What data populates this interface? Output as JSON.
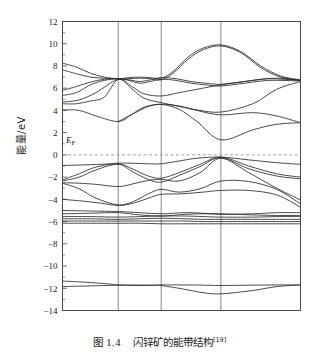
{
  "figure": {
    "caption_label": "图 1.4",
    "caption_text": "闪锌矿的能带结构",
    "caption_ref": "[19]",
    "ylabel": "能量/eV",
    "fermi_label": "E",
    "fermi_label_sub": "F"
  },
  "chart_data": {
    "type": "line",
    "title": "闪锌矿的能带结构",
    "xlabel": "",
    "ylabel": "能量/eV",
    "ylim": [
      -14,
      12
    ],
    "yticks": [
      12,
      10,
      8,
      6,
      4,
      2,
      0,
      -2,
      -4,
      -6,
      -8,
      -10,
      -12,
      -14
    ],
    "xticks": [
      "X",
      "R",
      "M",
      "G",
      "R"
    ],
    "xtick_positions": [
      0,
      1,
      2,
      3,
      4
    ],
    "grid": "vertical-only",
    "legend": "none",
    "annotations": [
      {
        "text": "E_F",
        "value": 0,
        "style": "dashed-horizontal-line"
      }
    ],
    "fermi_level": 0,
    "xlim": [
      0,
      4
    ],
    "segment_widths": [
      0.7,
      0.54,
      0.75,
      1.0
    ],
    "series": [
      {
        "name": "cb-1",
        "x": [
          0,
          0.25,
          0.5,
          0.75,
          1,
          1.25,
          1.5,
          1.75,
          2,
          2.2,
          2.45,
          2.7,
          3,
          3.25,
          3.5,
          3.75,
          4
        ],
        "values": [
          8.25,
          7.9,
          7.35,
          7.0,
          6.85,
          6.95,
          7.0,
          6.95,
          6.9,
          7.5,
          8.8,
          9.6,
          9.9,
          9.3,
          8.0,
          7.1,
          6.75
        ]
      },
      {
        "name": "cb-2",
        "x": [
          0,
          0.25,
          0.5,
          0.75,
          1,
          1.25,
          1.5,
          1.75,
          2,
          2.2,
          2.45,
          2.7,
          3,
          3.25,
          3.5,
          3.75,
          4
        ],
        "values": [
          7.65,
          7.3,
          7.0,
          6.9,
          6.85,
          6.85,
          6.9,
          6.85,
          6.75,
          7.35,
          8.6,
          9.45,
          9.8,
          9.2,
          7.85,
          7.0,
          6.7
        ]
      },
      {
        "name": "cb-3",
        "x": [
          0,
          0.25,
          0.5,
          0.75,
          1,
          1.25,
          1.5,
          1.75,
          2,
          2.25,
          2.5,
          2.75,
          3,
          3.3,
          3.6,
          4
        ],
        "values": [
          5.8,
          6.15,
          6.55,
          6.8,
          6.85,
          6.75,
          6.6,
          6.75,
          6.95,
          6.85,
          6.6,
          6.45,
          6.35,
          6.6,
          6.85,
          6.7
        ]
      },
      {
        "name": "cb-4",
        "x": [
          0,
          0.25,
          0.5,
          0.75,
          1,
          1.25,
          1.5,
          1.75,
          2,
          2.25,
          2.5,
          2.75,
          3,
          3.3,
          3.6,
          4
        ],
        "values": [
          5.35,
          5.6,
          6.3,
          6.7,
          6.85,
          6.7,
          6.45,
          6.6,
          6.8,
          6.7,
          6.45,
          6.3,
          6.2,
          6.45,
          6.7,
          6.65
        ]
      },
      {
        "name": "cb-5",
        "x": [
          0,
          0.3,
          0.6,
          1,
          1.3,
          1.6,
          2,
          2.3,
          2.6,
          3,
          3.4,
          3.7,
          4
        ],
        "values": [
          4.75,
          4.95,
          5.6,
          6.8,
          6.2,
          5.5,
          5.3,
          5.6,
          5.9,
          6.3,
          6.7,
          6.9,
          6.7
        ]
      },
      {
        "name": "cb-6",
        "x": [
          0,
          0.25,
          0.5,
          0.75,
          1,
          1.3,
          1.6,
          2,
          2.3,
          2.6,
          3,
          3.4,
          3.7,
          4
        ],
        "values": [
          4.6,
          4.6,
          4.85,
          5.2,
          6.8,
          6.0,
          5.1,
          4.7,
          4.35,
          4.05,
          3.85,
          4.6,
          5.9,
          6.6
        ]
      },
      {
        "name": "cb-7",
        "x": [
          0,
          0.3,
          0.6,
          1,
          1.3,
          1.6,
          2,
          2.3,
          2.6,
          3,
          3.4,
          3.7,
          4
        ],
        "values": [
          4.05,
          4.0,
          3.5,
          3.0,
          3.6,
          4.3,
          4.55,
          4.4,
          4.0,
          3.6,
          3.8,
          3.5,
          2.9
        ]
      },
      {
        "name": "cb-8",
        "x": [
          1,
          1.4,
          1.7,
          2,
          2.3,
          2.6,
          3,
          3.4,
          3.7,
          4
        ],
        "values": [
          3.0,
          3.8,
          4.35,
          4.55,
          4.1,
          3.0,
          1.35,
          2.25,
          2.75,
          2.9
        ]
      },
      {
        "name": "vb-1",
        "x": [
          0,
          0.4,
          0.8,
          1,
          1.3,
          1.7,
          2,
          2.3,
          2.6,
          3,
          3.35,
          3.7,
          4
        ],
        "values": [
          -0.95,
          -0.9,
          -0.82,
          -0.75,
          -0.75,
          -0.8,
          -0.8,
          -0.55,
          -0.3,
          -0.2,
          -0.45,
          -0.7,
          -0.85
        ]
      },
      {
        "name": "vb-2",
        "x": [
          0,
          0.3,
          0.6,
          1,
          1.35,
          1.7,
          2,
          2.3,
          2.65,
          3,
          3.35,
          3.7,
          4
        ],
        "values": [
          -2.25,
          -1.7,
          -1.1,
          -0.8,
          -1.3,
          -1.9,
          -2.1,
          -1.6,
          -0.85,
          -0.2,
          -1.0,
          -1.7,
          -2.0
        ]
      },
      {
        "name": "vb-3",
        "x": [
          0,
          0.3,
          0.6,
          1,
          1.35,
          1.7,
          2,
          2.3,
          2.65,
          3,
          3.35,
          3.7,
          4
        ],
        "values": [
          -2.35,
          -2.0,
          -1.35,
          -0.85,
          -1.55,
          -2.2,
          -2.45,
          -1.85,
          -1.05,
          -0.25,
          -1.25,
          -1.9,
          -2.15
        ]
      },
      {
        "name": "vb-4",
        "x": [
          0,
          0.3,
          0.6,
          1,
          1.35,
          1.7,
          2,
          2.3,
          2.65,
          3,
          3.35,
          3.7,
          4
        ],
        "values": [
          -2.5,
          -2.55,
          -2.65,
          -2.85,
          -2.6,
          -2.3,
          -2.2,
          -2.35,
          -1.6,
          -0.3,
          -1.6,
          -3.0,
          -4.05
        ]
      },
      {
        "name": "vb-5",
        "x": [
          0,
          0.3,
          0.6,
          1,
          1.35,
          1.7,
          2,
          2.3,
          2.65,
          3,
          3.35,
          3.7,
          4
        ],
        "values": [
          -2.55,
          -3.05,
          -3.9,
          -4.5,
          -4.2,
          -3.5,
          -3.1,
          -3.35,
          -3.05,
          -2.35,
          -2.4,
          -3.1,
          -4.4
        ]
      },
      {
        "name": "vb-6",
        "x": [
          0,
          0.35,
          0.7,
          1,
          1.35,
          1.7,
          2,
          2.35,
          2.7,
          3,
          3.35,
          3.7,
          4
        ],
        "values": [
          -4.0,
          -4.15,
          -4.35,
          -4.55,
          -4.35,
          -3.9,
          -3.55,
          -3.5,
          -3.35,
          -3.2,
          -3.2,
          -3.6,
          -4.7
        ]
      },
      {
        "name": "vb-7",
        "x": [
          0,
          0.5,
          1,
          1.5,
          2,
          2.4,
          2.7,
          3,
          3.4,
          3.7,
          4
        ],
        "values": [
          -5.0,
          -5.05,
          -5.1,
          -5.2,
          -5.3,
          -5.2,
          -5.25,
          -5.35,
          -5.3,
          -5.2,
          -5.2
        ]
      },
      {
        "name": "vb-8",
        "x": [
          0,
          0.5,
          1,
          1.5,
          2,
          2.4,
          2.7,
          3,
          3.4,
          3.7,
          4
        ],
        "values": [
          -5.3,
          -5.25,
          -5.2,
          -5.4,
          -5.5,
          -5.35,
          -5.3,
          -5.3,
          -5.4,
          -5.45,
          -5.45
        ]
      },
      {
        "name": "vb-9",
        "x": [
          0,
          0.5,
          1,
          1.5,
          2,
          2.4,
          2.7,
          3,
          3.4,
          3.7,
          4
        ],
        "values": [
          -5.55,
          -5.55,
          -5.6,
          -5.55,
          -5.5,
          -5.5,
          -5.55,
          -5.6,
          -5.6,
          -5.55,
          -5.55
        ]
      },
      {
        "name": "vb-10",
        "x": [
          0,
          0.5,
          1,
          1.5,
          2,
          2.4,
          2.7,
          3,
          3.4,
          3.7,
          4
        ],
        "values": [
          -5.75,
          -5.75,
          -5.8,
          -5.75,
          -5.7,
          -5.75,
          -5.8,
          -5.8,
          -5.8,
          -5.8,
          -5.8
        ]
      },
      {
        "name": "vb-11",
        "x": [
          0,
          0.5,
          1,
          1.5,
          2,
          2.4,
          2.7,
          3,
          3.4,
          3.7,
          4
        ],
        "values": [
          -5.95,
          -5.95,
          -5.95,
          -5.95,
          -5.95,
          -5.95,
          -6.0,
          -6.0,
          -6.0,
          -6.0,
          -6.0
        ]
      },
      {
        "name": "vb-12",
        "x": [
          0,
          0.5,
          1,
          1.5,
          2,
          2.4,
          2.7,
          3,
          3.4,
          3.7,
          4
        ],
        "values": [
          -6.15,
          -6.15,
          -6.15,
          -6.15,
          -6.2,
          -6.2,
          -6.2,
          -6.2,
          -6.2,
          -6.2,
          -6.2
        ]
      },
      {
        "name": "deep-1",
        "x": [
          0,
          0.4,
          0.8,
          1,
          1.4,
          1.8,
          2,
          2.4,
          2.7,
          3,
          3.4,
          3.7,
          4
        ],
        "values": [
          -11.35,
          -11.45,
          -11.6,
          -11.7,
          -11.72,
          -11.73,
          -11.7,
          -11.7,
          -11.72,
          -11.75,
          -11.72,
          -11.7,
          -11.7
        ]
      },
      {
        "name": "deep-2",
        "x": [
          0,
          0.4,
          0.8,
          1,
          1.4,
          1.8,
          2,
          2.4,
          2.7,
          3,
          3.4,
          3.7,
          4
        ],
        "values": [
          -11.85,
          -11.8,
          -11.75,
          -11.72,
          -11.73,
          -11.73,
          -11.75,
          -12.1,
          -12.4,
          -12.5,
          -12.2,
          -11.85,
          -11.7
        ]
      }
    ]
  }
}
